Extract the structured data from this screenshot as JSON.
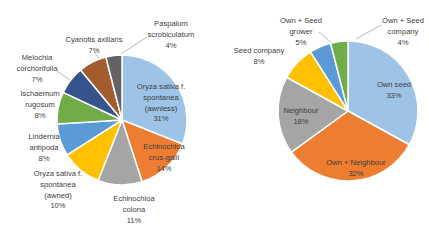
{
  "figure": {
    "width_px": 429,
    "height_px": 232,
    "background": "#FFFFFF",
    "text_color": "#404040",
    "leader_line_color": "#A6A6A6",
    "slice_border_color": "#FFFFFF"
  },
  "chart_data": [
    {
      "type": "pie",
      "title": "",
      "subtitle": "",
      "legend_position": "none",
      "data_labels": "category name + percentage",
      "start_angle_deg": 0,
      "direction": "clockwise",
      "categories": [
        "Oryza sativa f. spontanea (awnless)",
        "Echinochloa crus-galli",
        "Echinochloa colona",
        "Oryza sativa f. spontanea (awned)",
        "Lindernia antipoda",
        "Ischaemum rugosum",
        "Melochia corchorifolia",
        "Cyanotis axillaris",
        "Paspalum scrobiculatum"
      ],
      "values": [
        31,
        14,
        11,
        10,
        8,
        8,
        7,
        7,
        4
      ],
      "slices": [
        {
          "name": "Oryza sativa f. spontanea (awnless)",
          "value": 31,
          "color": "#9DC3E6",
          "placement": "inside",
          "label_lines": [
            "Oryza sativa f.",
            "spontanea",
            "(awnless)",
            "31%"
          ]
        },
        {
          "name": "Echinochloa crus-galli",
          "value": 14,
          "color": "#ED7D31",
          "placement": "inside",
          "label_color": "#774026",
          "label_lines": [
            "Echinochloa",
            "crus-galli",
            "14%"
          ]
        },
        {
          "name": "Echinochloa colona",
          "value": 11,
          "color": "#A5A5A5",
          "placement": "outside",
          "label_lines": [
            "Echinochloa",
            "colona",
            "11%"
          ]
        },
        {
          "name": "Oryza sativa f. spontanea (awned)",
          "value": 10,
          "color": "#FFC000",
          "placement": "outside",
          "label_lines": [
            "Oryza sativa f.",
            "spontanea",
            "(awned)",
            "10%"
          ]
        },
        {
          "name": "Lindernia antipoda",
          "value": 8,
          "color": "#5B9BD5",
          "placement": "outside",
          "label_lines": [
            "Lindernia",
            "antipoda",
            "8%"
          ]
        },
        {
          "name": "Ischaemum rugosum",
          "value": 8,
          "color": "#70AD47",
          "placement": "outside",
          "label_lines": [
            "Ischaemum",
            "rugosum",
            "8%"
          ]
        },
        {
          "name": "Melochia corchorifolia",
          "value": 7,
          "color": "#35548B",
          "placement": "outside",
          "label_lines": [
            "Melochia",
            "corchorifolia",
            "7%"
          ]
        },
        {
          "name": "Cyanotis axillaris",
          "value": 7,
          "color": "#A35C2E",
          "placement": "outside",
          "label_lines": [
            "Cyanotis axillaris",
            "7%"
          ]
        },
        {
          "name": "Paspalum scrobiculatum",
          "value": 4,
          "color": "#636363",
          "placement": "outside",
          "label_lines": [
            "Paspalum",
            "scrobiculatum",
            "4%"
          ]
        }
      ]
    },
    {
      "type": "pie",
      "title": "",
      "subtitle": "",
      "legend_position": "none",
      "data_labels": "category name + percentage",
      "start_angle_deg": 0,
      "direction": "clockwise",
      "categories": [
        "Own seed",
        "Own + Neighbour",
        "Neighbour",
        "Seed company",
        "Own + Seed grower",
        "Own + Seed company"
      ],
      "values": [
        33,
        32,
        18,
        8,
        5,
        4
      ],
      "slices": [
        {
          "name": "Own seed",
          "value": 33,
          "color": "#9DC3E6",
          "placement": "inside",
          "label_lines": [
            "Own seed",
            "33%"
          ]
        },
        {
          "name": "Own + Neighbour",
          "value": 32,
          "color": "#ED7D31",
          "placement": "inside",
          "label_color": "#774026",
          "label_lines": [
            "Own + Neighbour",
            "32%"
          ]
        },
        {
          "name": "Neighbour",
          "value": 18,
          "color": "#A5A5A5",
          "placement": "inside",
          "label_lines": [
            "Neighbour",
            "18%"
          ]
        },
        {
          "name": "Seed company",
          "value": 8,
          "color": "#FFC000",
          "placement": "outside",
          "label_lines": [
            "Seed company",
            "8%"
          ]
        },
        {
          "name": "Own + Seed grower",
          "value": 5,
          "color": "#5B9BD5",
          "placement": "outside",
          "label_lines": [
            "Own + Seed",
            "grower",
            "5%"
          ]
        },
        {
          "name": "Own + Seed company",
          "value": 4,
          "color": "#70AD47",
          "placement": "outside",
          "label_lines": [
            "Own + Seed",
            "company",
            "4%"
          ]
        }
      ]
    }
  ]
}
